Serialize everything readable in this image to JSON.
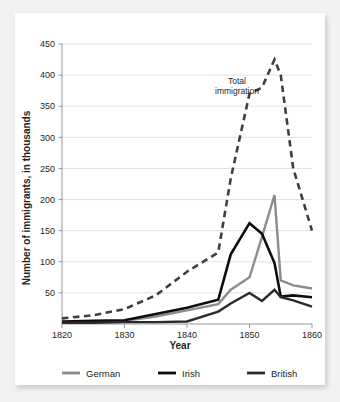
{
  "chart_data": {
    "type": "line",
    "title": "",
    "xlabel": "Year",
    "ylabel": "Number of immigrants, in thousands",
    "xlim": [
      1820,
      1860
    ],
    "ylim": [
      0,
      450
    ],
    "grid": true,
    "legend_position": "bottom",
    "x_ticks": [
      "1820",
      "1830",
      "1840",
      "1850",
      "1860"
    ],
    "y_ticks": [
      "50",
      "100",
      "150",
      "200",
      "250",
      "300",
      "350",
      "400",
      "450"
    ],
    "annotations": [
      {
        "text_line1": "Total",
        "text_line2": "immigration",
        "x": 1848,
        "y": 385
      }
    ],
    "series": [
      {
        "name": "Total immigration",
        "color": "#3f3f3f",
        "style": "dashed",
        "width": 2.6,
        "in_legend": false,
        "x": [
          1820,
          1825,
          1830,
          1835,
          1840,
          1845,
          1847,
          1850,
          1852,
          1854,
          1855,
          1857,
          1860
        ],
        "values": [
          9,
          14,
          24,
          46,
          84,
          115,
          234,
          370,
          380,
          425,
          400,
          250,
          150
        ]
      },
      {
        "name": "German",
        "color": "#8c8c8c",
        "style": "solid",
        "width": 2.4,
        "in_legend": true,
        "x": [
          1820,
          1825,
          1830,
          1835,
          1840,
          1845,
          1847,
          1850,
          1852,
          1854,
          1855,
          1857,
          1860
        ],
        "values": [
          3,
          4,
          5,
          12,
          22,
          32,
          55,
          75,
          140,
          207,
          70,
          62,
          57
        ]
      },
      {
        "name": "Irish",
        "color": "#0d0d0d",
        "style": "solid",
        "width": 2.6,
        "in_legend": true,
        "x": [
          1820,
          1825,
          1830,
          1835,
          1840,
          1845,
          1847,
          1850,
          1852,
          1854,
          1855,
          1857,
          1860
        ],
        "values": [
          4,
          5,
          6,
          16,
          26,
          39,
          112,
          162,
          145,
          98,
          44,
          46,
          43
        ]
      },
      {
        "name": "British",
        "color": "#2b2b2b",
        "style": "solid",
        "width": 2.4,
        "in_legend": true,
        "x": [
          1820,
          1825,
          1830,
          1835,
          1840,
          1845,
          1847,
          1850,
          1852,
          1854,
          1855,
          1857,
          1860
        ],
        "values": [
          2,
          2,
          3,
          3,
          4,
          20,
          33,
          50,
          37,
          55,
          43,
          38,
          28
        ]
      }
    ]
  },
  "legend": {
    "items": [
      {
        "label": "German",
        "color": "#8c8c8c"
      },
      {
        "label": "Irish",
        "color": "#0d0d0d"
      },
      {
        "label": "British",
        "color": "#2b2b2b"
      }
    ]
  },
  "colors": {
    "background": "#f2f2f2",
    "card": "#ffffff",
    "grid": "#d9d9d9",
    "axis": "#8c8c8c",
    "text": "#231f20"
  }
}
